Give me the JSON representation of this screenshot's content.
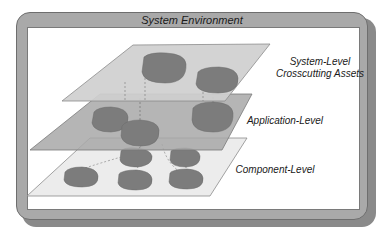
{
  "diagram": {
    "title": "System Environment",
    "layers": [
      {
        "id": "system",
        "label_line1": "System-Level",
        "label_line2": "Crosscutting Assets",
        "blob_count": 2
      },
      {
        "id": "application",
        "label": "Application-Level",
        "blob_count": 3
      },
      {
        "id": "component",
        "label": "Component-Level",
        "blob_count": 6
      }
    ],
    "colors": {
      "frame": "#a9a9a9",
      "frame_shadow": "#8a8a8a",
      "system_plane": "#cfcfcf",
      "application_plane": "#a8a8a8",
      "component_plane": "#ececec",
      "blob": "#7c7c7c"
    }
  }
}
